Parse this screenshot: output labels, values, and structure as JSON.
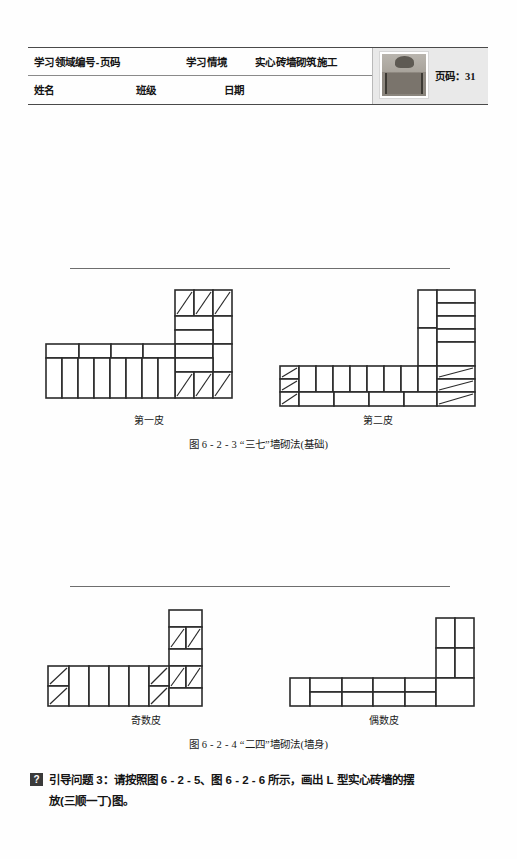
{
  "header": {
    "field_label": "学习领域编号-页码",
    "situation_label": "学习情境",
    "topic": "实心砖墙砌筑施工",
    "name_label": "姓名",
    "class_label": "班级",
    "date_label": "日期",
    "page_label": "页码：",
    "page_number": "31",
    "thumbnail_name": "brick-building-photo"
  },
  "figures": [
    {
      "id": "fig-6-2-3",
      "caption": "图 6 - 2 - 3  “三七”墙砌法(基础)",
      "left_label": "第一皮",
      "right_label": "第二皮"
    },
    {
      "id": "fig-6-2-4",
      "caption": "图 6 - 2 - 4  “二四”墙砌法(墙身)",
      "left_label": "奇数皮",
      "right_label": "偶数皮"
    }
  ],
  "question": {
    "badge": "?",
    "line1": "引导问题 3：请按照图 6 - 2 - 5、图 6 - 2 - 6 所示，画出 L 型实心砖墙的摆",
    "line2": "放(三顺一丁)图。"
  },
  "colors": {
    "ink": "#1a1a1a",
    "line": "#2b2b2b",
    "rule": "#6e6e6e",
    "header_panel": "#e9e9e9",
    "badge": "#3a3a3a"
  }
}
